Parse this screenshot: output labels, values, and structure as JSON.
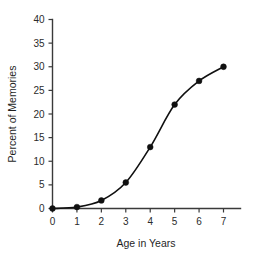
{
  "chart_data": {
    "type": "line",
    "title": "",
    "xlabel": "Age in Years",
    "ylabel": "Percent of Memories",
    "x": [
      0,
      1,
      2,
      3,
      4,
      5,
      6,
      7
    ],
    "values": [
      0,
      0.3,
      1.7,
      5.5,
      13,
      22,
      27,
      30
    ],
    "series": [
      {
        "name": "Percent of Memories",
        "values": [
          0,
          0.3,
          1.7,
          5.5,
          13,
          22,
          27,
          30
        ]
      }
    ],
    "xlim": [
      0,
      7
    ],
    "ylim": [
      0,
      40
    ],
    "x_ticks": [
      0,
      1,
      2,
      3,
      4,
      5,
      6,
      7
    ],
    "y_ticks": [
      0,
      5,
      10,
      15,
      20,
      25,
      30,
      35,
      40
    ],
    "x_tick_labels": [
      "0",
      "1",
      "2",
      "3",
      "4",
      "5",
      "6",
      "7"
    ],
    "y_tick_labels": [
      "0",
      "5",
      "10",
      "15",
      "20",
      "25",
      "30",
      "35",
      "40"
    ],
    "grid": false,
    "legend": false,
    "legend_position": "none",
    "marker": "circle",
    "line_color": "#101010",
    "marker_color": "#101010",
    "axis_color": "#3a3a3a",
    "background_color": "#ffffff"
  },
  "axes": {
    "x_title": "Age in Years",
    "y_title": "Percent of Memories"
  }
}
